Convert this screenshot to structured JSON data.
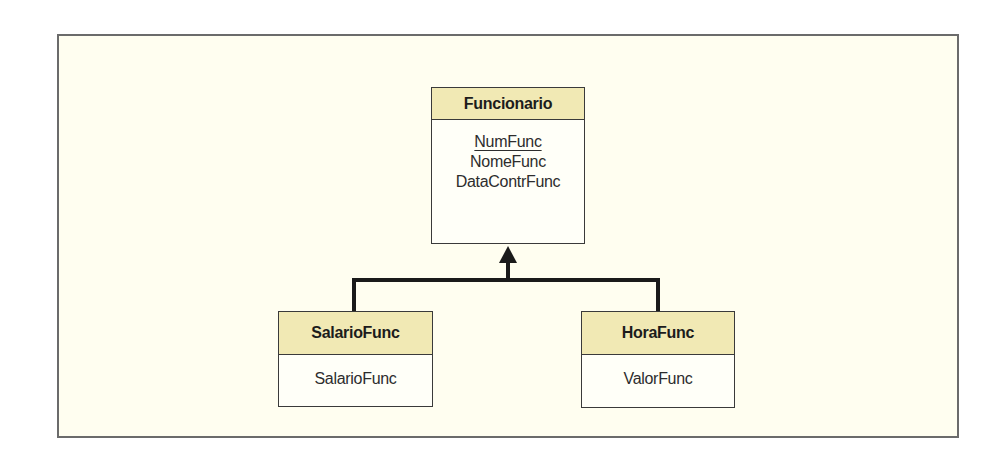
{
  "diagram": {
    "type": "uml-class-generalization",
    "colors": {
      "header_fill": "#f1e9b4",
      "body_fill": "#fffff8",
      "background": "#fffef0",
      "line": "#1a1a1a"
    },
    "parent": {
      "name": "Funcionario",
      "attributes": [
        {
          "label": "NumFunc",
          "primary_key": true
        },
        {
          "label": "NomeFunc",
          "primary_key": false
        },
        {
          "label": "DataContrFunc",
          "primary_key": false
        }
      ]
    },
    "children": [
      {
        "name": "SalarioFunc",
        "attributes": [
          {
            "label": "SalarioFunc"
          }
        ]
      },
      {
        "name": "HoraFunc",
        "attributes": [
          {
            "label": "ValorFunc"
          }
        ]
      }
    ],
    "relationship": "generalization"
  }
}
